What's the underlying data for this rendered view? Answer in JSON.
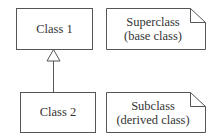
{
  "diagram": {
    "type": "UML class inheritance",
    "classes": [
      {
        "id": "class1",
        "label": "Class 1"
      },
      {
        "id": "class2",
        "label": "Class 2"
      }
    ],
    "relation": {
      "from": "class2",
      "to": "class1",
      "kind": "generalization"
    },
    "notes": [
      {
        "id": "note1",
        "line1": "Superclass",
        "line2": "(base class)"
      },
      {
        "id": "note2",
        "line1": "Subclass",
        "line2": "(derived class)"
      }
    ],
    "colors": {
      "stroke": "#555555",
      "text": "#333333",
      "background": "#ffffff"
    }
  }
}
